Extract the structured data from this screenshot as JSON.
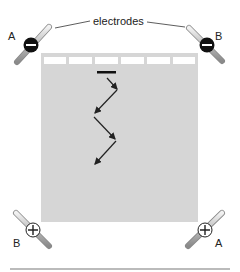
{
  "labels": {
    "electrodes": "electrodes",
    "top_left": "A",
    "top_right": "B",
    "bottom_left": "B",
    "bottom_right": "A"
  },
  "electrodes": [
    {
      "position": "top-left",
      "label": "A",
      "polarity": "negative",
      "symbol": "−"
    },
    {
      "position": "top-right",
      "label": "B",
      "polarity": "negative",
      "symbol": "−"
    },
    {
      "position": "bottom-left",
      "label": "B",
      "polarity": "positive",
      "symbol": "+"
    },
    {
      "position": "bottom-right",
      "label": "A",
      "polarity": "positive",
      "symbol": "+"
    }
  ],
  "gel": {
    "wells": 6,
    "color": "#d9d9d9"
  },
  "migration_path": "zigzag arrows from well downward"
}
